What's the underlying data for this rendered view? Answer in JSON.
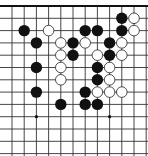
{
  "board": {
    "title": "Go board diagram (partial, top edge)",
    "grid": {
      "columns": 12,
      "rows": 13,
      "x0": 12,
      "dx": 12.2,
      "y0": 6,
      "dy": 12.3,
      "line_color": "#333333",
      "edge_color": "#111111",
      "background": "#ffffff"
    },
    "star_points": [
      {
        "c": 2,
        "r": 9
      },
      {
        "c": 8,
        "r": 9
      }
    ],
    "stones": [
      {
        "color": "black",
        "c": 9,
        "r": 1
      },
      {
        "color": "white",
        "c": 10,
        "r": 1
      },
      {
        "color": "black",
        "c": 1,
        "r": 2
      },
      {
        "color": "white",
        "c": 3,
        "r": 2
      },
      {
        "color": "black",
        "c": 6,
        "r": 2
      },
      {
        "color": "black",
        "c": 7,
        "r": 2
      },
      {
        "color": "black",
        "c": 9,
        "r": 2
      },
      {
        "color": "white",
        "c": 10,
        "r": 2
      },
      {
        "color": "black",
        "c": 2,
        "r": 3
      },
      {
        "color": "white",
        "c": 4,
        "r": 3
      },
      {
        "color": "black",
        "c": 5,
        "r": 3
      },
      {
        "color": "white",
        "c": 6,
        "r": 3
      },
      {
        "color": "black",
        "c": 8,
        "r": 3
      },
      {
        "color": "white",
        "c": 9,
        "r": 3
      },
      {
        "color": "white",
        "c": 4,
        "r": 4
      },
      {
        "color": "black",
        "c": 5,
        "r": 4
      },
      {
        "color": "white",
        "c": 7,
        "r": 4
      },
      {
        "color": "black",
        "c": 8,
        "r": 4
      },
      {
        "color": "white",
        "c": 9,
        "r": 4
      },
      {
        "color": "black",
        "c": 2,
        "r": 5
      },
      {
        "color": "white",
        "c": 4,
        "r": 5
      },
      {
        "color": "black",
        "c": 7,
        "r": 5
      },
      {
        "color": "white",
        "c": 8,
        "r": 5
      },
      {
        "color": "white",
        "c": 4,
        "r": 6
      },
      {
        "color": "black",
        "c": 7,
        "r": 6
      },
      {
        "color": "white",
        "c": 8,
        "r": 6
      },
      {
        "color": "black",
        "c": 2,
        "r": 7
      },
      {
        "color": "black",
        "c": 6,
        "r": 7
      },
      {
        "color": "white",
        "c": 7,
        "r": 7
      },
      {
        "color": "white",
        "c": 8,
        "r": 7
      },
      {
        "color": "white",
        "c": 9,
        "r": 7
      },
      {
        "color": "black",
        "c": 4,
        "r": 8
      },
      {
        "color": "black",
        "c": 6,
        "r": 8
      },
      {
        "color": "black",
        "c": 7,
        "r": 8
      }
    ],
    "colors": {
      "black_stone": "#111111",
      "white_stone_fill": "#ffffff",
      "white_stone_stroke": "#222222"
    }
  }
}
